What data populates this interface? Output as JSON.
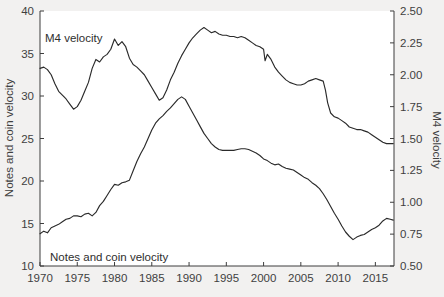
{
  "figure": {
    "background_color": "#f2f1f0",
    "plot_background_color": "#ffffff",
    "line_color": "#2a2a2a",
    "axis_color": "#3d3d3d"
  },
  "annotations": {
    "m4_label": "M4 velocity",
    "notes_label": "Notes and coin velocity"
  },
  "chart_data": {
    "type": "line",
    "title": "",
    "xlabel": "",
    "ylabel": "Notes and coin velocity",
    "y2label": "M4 velocity",
    "grid": false,
    "legend_position": "inline-annotation",
    "xlim": [
      1970,
      2017.5
    ],
    "ylim": [
      10,
      40
    ],
    "y2lim": [
      0.5,
      2.5
    ],
    "xticks": [
      1970,
      1975,
      1980,
      1985,
      1990,
      1995,
      2000,
      2005,
      2010,
      2015
    ],
    "xticklabels": [
      "1970",
      "1975",
      "1980",
      "1985",
      "1990",
      "1995",
      "2000",
      "2005",
      "2010",
      "2015"
    ],
    "yticks": [
      10,
      15,
      20,
      25,
      30,
      35,
      40
    ],
    "yticklabels": [
      "10",
      "15",
      "20",
      "25",
      "30",
      "35",
      "40"
    ],
    "y2ticks": [
      0.5,
      0.75,
      1.0,
      1.25,
      1.5,
      1.75,
      2.0,
      2.25,
      2.5
    ],
    "y2ticklabels": [
      "0.50",
      "0.75",
      "1.00",
      "1.25",
      "1.50",
      "1.75",
      "2.00",
      "2.25",
      "2.50"
    ],
    "series": [
      {
        "name": "Notes and coin velocity",
        "axis": "left",
        "x": [
          1970.0,
          1970.5,
          1971.0,
          1971.5,
          1972.0,
          1972.5,
          1973.0,
          1973.5,
          1974.0,
          1974.5,
          1975.0,
          1975.5,
          1976.0,
          1976.5,
          1977.0,
          1977.5,
          1978.0,
          1978.5,
          1979.0,
          1979.5,
          1980.0,
          1980.5,
          1981.0,
          1981.5,
          1982.0,
          1982.5,
          1983.0,
          1983.5,
          1984.0,
          1984.5,
          1985.0,
          1985.5,
          1986.0,
          1986.5,
          1987.0,
          1987.5,
          1988.0,
          1988.5,
          1989.0,
          1989.5,
          1990.0,
          1990.5,
          1991.0,
          1991.5,
          1992.0,
          1992.5,
          1993.0,
          1993.5,
          1994.0,
          1994.5,
          1995.0,
          1995.5,
          1996.0,
          1996.5,
          1997.0,
          1997.5,
          1998.0,
          1998.5,
          1999.0,
          1999.5,
          2000.0,
          2000.5,
          2001.0,
          2001.5,
          2002.0,
          2002.5,
          2003.0,
          2003.5,
          2004.0,
          2004.5,
          2005.0,
          2005.5,
          2006.0,
          2006.5,
          2007.0,
          2007.5,
          2008.0,
          2008.5,
          2009.0,
          2009.5,
          2010.0,
          2010.5,
          2011.0,
          2011.5,
          2012.0,
          2012.5,
          2013.0,
          2013.5,
          2014.0,
          2014.5,
          2015.0,
          2015.5,
          2016.0,
          2016.5,
          2017.0,
          2017.4
        ],
        "y": [
          13.8,
          14.1,
          13.9,
          14.5,
          14.7,
          14.9,
          15.2,
          15.5,
          15.6,
          15.9,
          15.9,
          15.8,
          16.1,
          16.2,
          15.9,
          16.3,
          17.1,
          17.6,
          18.3,
          19.0,
          19.6,
          19.5,
          19.8,
          19.9,
          20.1,
          21.2,
          22.3,
          23.2,
          24.0,
          25.0,
          26.0,
          26.8,
          27.3,
          27.7,
          28.2,
          28.6,
          29.1,
          29.6,
          29.9,
          29.6,
          28.8,
          28.0,
          27.2,
          26.4,
          25.6,
          25.0,
          24.4,
          24.0,
          23.7,
          23.6,
          23.6,
          23.6,
          23.6,
          23.7,
          23.8,
          23.8,
          23.7,
          23.5,
          23.3,
          23.0,
          22.6,
          22.4,
          22.1,
          21.9,
          22.0,
          21.7,
          21.5,
          21.4,
          21.3,
          21.0,
          20.7,
          20.4,
          20.2,
          19.8,
          19.5,
          19.1,
          18.5,
          17.8,
          17.0,
          16.2,
          15.5,
          14.7,
          14.0,
          13.5,
          13.1,
          13.4,
          13.6,
          13.7,
          14.0,
          14.3,
          14.5,
          14.8,
          15.3,
          15.6,
          15.5,
          15.4
        ]
      },
      {
        "name": "M4 velocity",
        "axis": "right",
        "x": [
          1970.0,
          1970.5,
          1971.0,
          1971.5,
          1972.0,
          1972.5,
          1973.0,
          1973.5,
          1974.0,
          1974.5,
          1975.0,
          1975.5,
          1976.0,
          1976.5,
          1977.0,
          1977.5,
          1978.0,
          1978.5,
          1979.0,
          1979.5,
          1980.0,
          1980.5,
          1981.0,
          1981.5,
          1982.0,
          1982.5,
          1983.0,
          1983.5,
          1984.0,
          1984.5,
          1985.0,
          1985.5,
          1986.0,
          1986.5,
          1987.0,
          1987.5,
          1988.0,
          1988.5,
          1989.0,
          1989.5,
          1990.0,
          1990.5,
          1991.0,
          1991.5,
          1992.0,
          1992.5,
          1993.0,
          1993.5,
          1994.0,
          1994.5,
          1995.0,
          1995.5,
          1996.0,
          1996.5,
          1997.0,
          1997.5,
          1998.0,
          1998.5,
          1999.0,
          1999.5,
          2000.0,
          2000.2,
          2000.5,
          2001.0,
          2001.5,
          2002.0,
          2002.5,
          2003.0,
          2003.5,
          2004.0,
          2004.5,
          2005.0,
          2005.5,
          2006.0,
          2006.5,
          2007.0,
          2007.5,
          2008.0,
          2008.3,
          2008.6,
          2009.0,
          2009.5,
          2010.0,
          2010.5,
          2011.0,
          2011.5,
          2012.0,
          2012.5,
          2013.0,
          2013.5,
          2014.0,
          2014.5,
          2015.0,
          2015.5,
          2016.0,
          2016.5,
          2017.0,
          2017.4
        ],
        "y": [
          2.05,
          2.06,
          2.04,
          2.0,
          1.93,
          1.87,
          1.84,
          1.81,
          1.77,
          1.73,
          1.75,
          1.8,
          1.87,
          1.94,
          2.05,
          2.12,
          2.1,
          2.14,
          2.16,
          2.2,
          2.28,
          2.23,
          2.26,
          2.22,
          2.13,
          2.08,
          2.06,
          2.03,
          2.0,
          1.95,
          1.9,
          1.85,
          1.8,
          1.82,
          1.88,
          1.96,
          2.02,
          2.09,
          2.15,
          2.2,
          2.25,
          2.29,
          2.32,
          2.35,
          2.37,
          2.35,
          2.33,
          2.34,
          2.32,
          2.31,
          2.31,
          2.3,
          2.3,
          2.29,
          2.3,
          2.29,
          2.27,
          2.25,
          2.23,
          2.22,
          2.2,
          2.11,
          2.16,
          2.12,
          2.06,
          2.02,
          1.99,
          1.96,
          1.94,
          1.93,
          1.92,
          1.92,
          1.93,
          1.95,
          1.96,
          1.97,
          1.96,
          1.95,
          1.88,
          1.78,
          1.7,
          1.67,
          1.66,
          1.64,
          1.62,
          1.59,
          1.58,
          1.57,
          1.57,
          1.56,
          1.55,
          1.53,
          1.51,
          1.49,
          1.47,
          1.46,
          1.46,
          1.46
        ]
      }
    ]
  }
}
